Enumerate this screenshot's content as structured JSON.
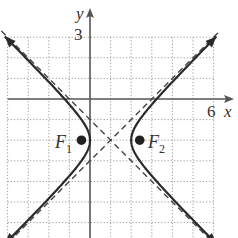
{
  "figure": {
    "type": "hyperbola-graph",
    "equation": "(x-1)^2 - (y+2)^2 = 1",
    "center": [
      1,
      -2
    ],
    "a": 1,
    "b": 1,
    "foci": [
      {
        "label": "F",
        "subscript": "1",
        "x": -0.414,
        "y": -2
      },
      {
        "label": "F",
        "subscript": "2",
        "x": 2.414,
        "y": -2
      }
    ],
    "asymptotes": [
      "y + 2 = x - 1",
      "y + 2 = -(x - 1)"
    ]
  },
  "axes": {
    "x_label": "x",
    "y_label": "y",
    "x_tick_label": "6",
    "y_tick_label": "3",
    "x_range": [
      -4,
      6
    ],
    "y_range": [
      -6.5,
      3
    ],
    "grid": "dotted",
    "grid_step": 1
  },
  "labels": {
    "x_axis": "x",
    "y_axis": "y",
    "x_tick": "6",
    "y_tick": "3",
    "f1_main": "F",
    "f1_sub": "1",
    "f2_main": "F",
    "f2_sub": "2"
  },
  "colors": {
    "curve": "#2a2a2a",
    "axis": "#555555",
    "grid": "#9a9a9a",
    "asymptote": "#444444",
    "focus": "#222222"
  }
}
